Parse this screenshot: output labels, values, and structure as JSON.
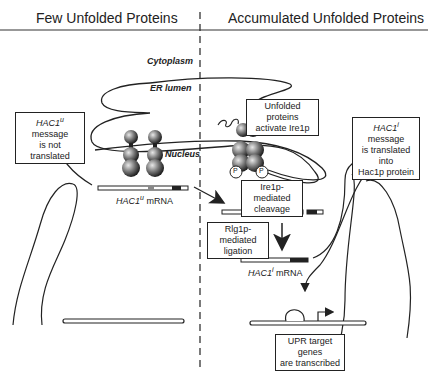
{
  "header": {
    "left_title": "Few Unfolded Proteins",
    "right_title": "Accumulated Unfolded Proteins"
  },
  "compartments": {
    "cytoplasm": "Cytoplasm",
    "er_lumen": "ER lumen",
    "nucleus": "Nucleus"
  },
  "left_panel": {
    "mrna_gene": "HAC1",
    "mrna_superscript": "u",
    "mrna_suffix": "mRNA",
    "message_box": {
      "gene": "HAC1",
      "superscript": "u",
      "line1_rest": " message",
      "line2": "is not translated"
    }
  },
  "right_panel": {
    "activation_box": {
      "line1": "Unfolded proteins",
      "line2": "activate Ire1p"
    },
    "cleavage_box": {
      "line1": "Ire1p-mediated",
      "line2": "cleavage"
    },
    "ligation_box": {
      "line1": "Rlg1p-mediated",
      "line2": "ligation"
    },
    "spliced_mrna": {
      "gene": "HAC1",
      "superscript": "i",
      "suffix": "mRNA"
    },
    "translated_box": {
      "gene": "HAC1",
      "superscript": "i",
      "line1_rest": " message",
      "line2": "is translated into",
      "line3": "Hac1p protein"
    },
    "transcription_box": {
      "line1": "UPR target genes",
      "line2": "are transcribed"
    },
    "phospho_label": "P"
  }
}
